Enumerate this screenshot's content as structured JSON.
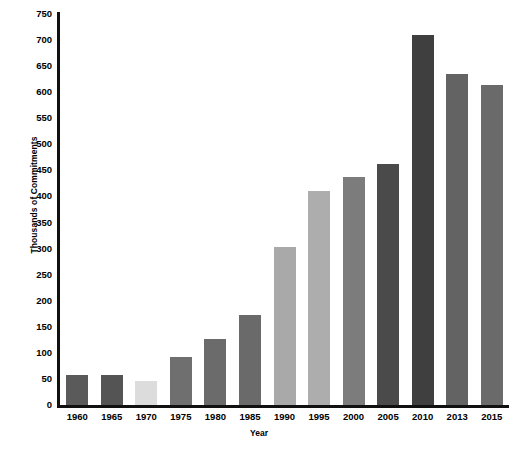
{
  "chart_data": {
    "type": "bar",
    "title": "",
    "subtitle": "",
    "xlabel": "Year",
    "ylabel": "Thousands of Commitments",
    "categories": [
      "1960",
      "1965",
      "1970",
      "1975",
      "1980",
      "1985",
      "1990",
      "1995",
      "2000",
      "2005",
      "2010",
      "2013",
      "2015"
    ],
    "values": [
      57,
      57,
      46,
      92,
      127,
      172,
      303,
      411,
      438,
      462,
      710,
      635,
      613
    ],
    "bar_colors": [
      "#5a5a5a",
      "#545454",
      "#dcdcdc",
      "#6f6f6f",
      "#6b6b6b",
      "#6a6a6a",
      "#a9a9a9",
      "#adadad",
      "#7c7c7c",
      "#4a4a4a",
      "#3f3f3f",
      "#636363",
      "#6a6a6a"
    ],
    "ylim": [
      0,
      750
    ],
    "yticks": [
      0,
      50,
      100,
      150,
      200,
      250,
      300,
      350,
      400,
      450,
      500,
      550,
      600,
      650,
      700,
      750
    ],
    "ytick_labels": [
      "0",
      "50",
      "100",
      "150",
      "200",
      "250",
      "300",
      "350",
      "400",
      "450",
      "500",
      "550",
      "600",
      "650",
      "700",
      "750"
    ],
    "grid": false,
    "legend": null,
    "legend_position": "none",
    "axis_color": "#111111",
    "background_color": "#ffffff"
  }
}
